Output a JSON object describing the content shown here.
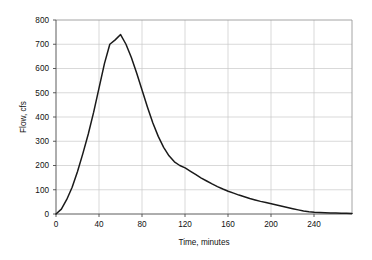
{
  "chart_data": {
    "type": "line",
    "title": "",
    "subtitle": "",
    "xlabel": "Time, minutes",
    "ylabel": "Flow, cfs",
    "xlim": [
      0,
      275
    ],
    "ylim": [
      0,
      800
    ],
    "xticks": [
      0,
      40,
      80,
      120,
      160,
      200,
      240
    ],
    "yticks": [
      0,
      100,
      200,
      300,
      400,
      500,
      600,
      700,
      800
    ],
    "grid": true,
    "legend": null,
    "legend_position": "none",
    "line_color": "#1a1a1a",
    "grid_color": "#c8c8c8",
    "axis_color": "#808080",
    "background_color": "#ffffff",
    "series": [
      {
        "name": "Flow",
        "x": [
          0,
          5,
          10,
          15,
          20,
          25,
          30,
          35,
          40,
          45,
          50,
          55,
          60,
          65,
          70,
          75,
          80,
          85,
          90,
          95,
          100,
          105,
          110,
          115,
          120,
          125,
          130,
          135,
          140,
          145,
          150,
          155,
          160,
          165,
          170,
          175,
          180,
          185,
          190,
          195,
          200,
          205,
          210,
          215,
          220,
          225,
          230,
          235,
          240,
          245,
          250,
          255,
          260,
          265,
          270,
          275
        ],
        "values": [
          0,
          20,
          60,
          110,
          175,
          250,
          330,
          420,
          520,
          620,
          700,
          718,
          740,
          700,
          645,
          580,
          510,
          440,
          375,
          320,
          275,
          240,
          215,
          200,
          190,
          176,
          162,
          148,
          136,
          124,
          113,
          103,
          94,
          86,
          78,
          71,
          64,
          58,
          52,
          47,
          42,
          37,
          32,
          27,
          22,
          17,
          12,
          9,
          7,
          6,
          5,
          4,
          4,
          3,
          3,
          2
        ]
      }
    ],
    "peak": {
      "x": 60,
      "y": 740
    }
  },
  "axes": {
    "y_tick_labels": [
      "800",
      "700",
      "600",
      "500",
      "400",
      "300",
      "200",
      "100",
      "0"
    ],
    "x_tick_labels": [
      "0",
      "40",
      "80",
      "120",
      "160",
      "200",
      "240"
    ],
    "x_axis_title": "Time, minutes",
    "y_axis_title": "Flow, cfs"
  }
}
